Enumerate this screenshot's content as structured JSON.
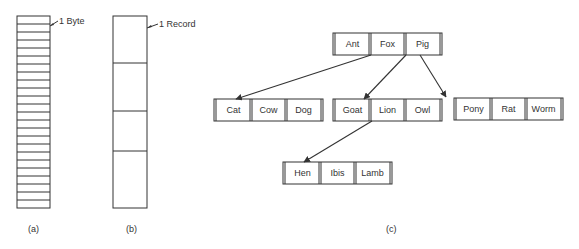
{
  "figure": {
    "panel_a": {
      "caption": "(a)",
      "annotation": "1 Byte",
      "row_count": 24
    },
    "panel_b": {
      "caption": "(b)",
      "annotation": "1 Record",
      "cells": 4
    },
    "panel_c": {
      "caption": "(c)",
      "root": {
        "keys": [
          "Ant",
          "Fox",
          "Pig"
        ]
      },
      "level2": [
        {
          "keys": [
            "Cat",
            "Cow",
            "Dog"
          ]
        },
        {
          "keys": [
            "Goat",
            "Lion",
            "Owl"
          ]
        },
        {
          "keys": [
            "Pony",
            "Rat",
            "Worm"
          ]
        }
      ],
      "level3": [
        {
          "keys": [
            "Hen",
            "Ibis",
            "Lamb"
          ],
          "parent": "Goat/Lion/Owl"
        }
      ]
    }
  },
  "colors": {
    "line": "#333333",
    "background": "#ffffff"
  }
}
